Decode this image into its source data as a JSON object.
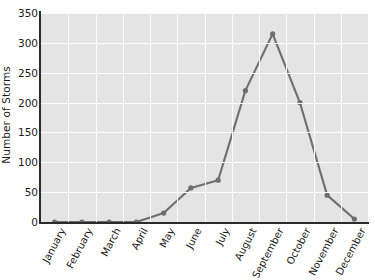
{
  "chart_data": {
    "type": "line",
    "title": "",
    "xlabel": "",
    "ylabel": "Number of Storms",
    "categories": [
      "January",
      "February",
      "March",
      "April",
      "May",
      "June",
      "July",
      "August",
      "September",
      "October",
      "November",
      "December"
    ],
    "values": [
      0,
      0,
      0,
      0,
      15,
      57,
      70,
      220,
      315,
      200,
      45,
      5
    ],
    "series": [
      {
        "name": "Number of Storms",
        "values": [
          0,
          0,
          0,
          0,
          15,
          57,
          70,
          220,
          315,
          200,
          45,
          5
        ]
      }
    ],
    "ylim": [
      0,
      350
    ],
    "yticks": [
      0,
      50,
      100,
      150,
      200,
      250,
      300,
      350
    ],
    "ytick_labels": [
      "0",
      "50",
      "100",
      "150",
      "200",
      "250",
      "300",
      "350"
    ],
    "grid": true,
    "legend": "none",
    "marker": "circle",
    "colors": {
      "line": "#6e6e6e",
      "marker": "#6e6e6e",
      "plot_background": "#e4e4e4",
      "gridline": "#fbfbfb",
      "axis": "#2b2b2b",
      "text": "#1a1a1a",
      "page_background": "#ffffff"
    }
  }
}
